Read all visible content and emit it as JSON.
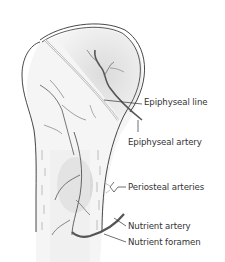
{
  "figure": {
    "labels": [
      {
        "id": "epiphyseal-line",
        "text": "Epiphyseal line",
        "x": 144,
        "y": 102
      },
      {
        "id": "epiphyseal-artery",
        "text": "Epiphyseal artery",
        "x": 128,
        "y": 141
      },
      {
        "id": "periosteal-arteries",
        "text": "Periosteal arteries",
        "x": 128,
        "y": 186
      },
      {
        "id": "nutrient-artery",
        "text": "Nutrient artery",
        "x": 128,
        "y": 225
      },
      {
        "id": "nutrient-foramen",
        "text": "Nutrient foramen",
        "x": 128,
        "y": 241
      }
    ],
    "colors": {
      "outline": "#333333",
      "vessel": "#555555",
      "shading": "#d9d9d9",
      "background": "#ffffff"
    }
  }
}
